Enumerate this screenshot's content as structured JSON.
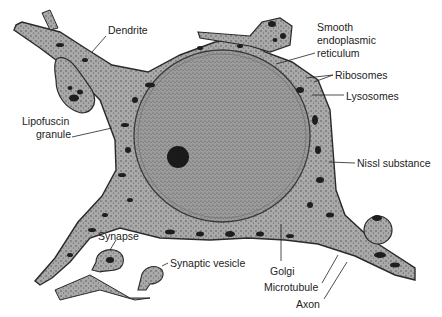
{
  "figure": {
    "colors": {
      "background": "#ffffff",
      "cytoplasm": "#a9a9a9",
      "nucleus": "#9a9a9a",
      "organelle": "#1e1e1e",
      "outline": "#2a2a2a",
      "label_text": "#222222"
    },
    "labels": [
      {
        "id": "dendrite",
        "text": "Dendrite",
        "x": 108,
        "y": 30
      },
      {
        "id": "smooth-er-1",
        "text": "Smooth",
        "x": 317,
        "y": 27
      },
      {
        "id": "smooth-er-2",
        "text": "endoplasmic",
        "x": 317,
        "y": 40
      },
      {
        "id": "smooth-er-3",
        "text": "reticulum",
        "x": 317,
        "y": 53
      },
      {
        "id": "ribosomes",
        "text": "Ribosomes",
        "x": 335,
        "y": 69
      },
      {
        "id": "lysosomes",
        "text": "Lysosomes",
        "x": 346,
        "y": 90
      },
      {
        "id": "lipofuscin-1",
        "text": "Lipofuscin",
        "x": 22,
        "y": 119
      },
      {
        "id": "lipofuscin-2",
        "text": "granule",
        "x": 36,
        "y": 132
      },
      {
        "id": "nissl",
        "text": "Nissl substance",
        "x": 357,
        "y": 157
      },
      {
        "id": "synapse",
        "text": "Synapse",
        "x": 98,
        "y": 230
      },
      {
        "id": "synaptic-vesicle",
        "text": "Synaptic vesicle",
        "x": 170,
        "y": 257
      },
      {
        "id": "golgi",
        "text": "Golgi",
        "x": 270,
        "y": 265
      },
      {
        "id": "microtubule",
        "text": "Microtubule",
        "x": 264,
        "y": 281
      },
      {
        "id": "axon",
        "text": "Axon",
        "x": 296,
        "y": 298
      }
    ],
    "leaders": [
      {
        "id": "dendrite",
        "x1": 106,
        "y1": 36,
        "x2": 92,
        "y2": 52
      },
      {
        "id": "smooth-er",
        "x1": 315,
        "y1": 53,
        "x2": 276,
        "y2": 64
      },
      {
        "id": "ribosomes-a",
        "x1": 333,
        "y1": 75,
        "x2": 306,
        "y2": 78
      },
      {
        "id": "ribosomes-b",
        "x1": 333,
        "y1": 75,
        "x2": 314,
        "y2": 82
      },
      {
        "id": "lysosomes",
        "x1": 344,
        "y1": 95,
        "x2": 312,
        "y2": 95
      },
      {
        "id": "lipofuscin",
        "x1": 72,
        "y1": 137,
        "x2": 112,
        "y2": 128
      },
      {
        "id": "nissl",
        "x1": 355,
        "y1": 163,
        "x2": 329,
        "y2": 162
      },
      {
        "id": "synapse",
        "x1": 116,
        "y1": 240,
        "x2": 110,
        "y2": 250
      },
      {
        "id": "synaptic-vesicle",
        "x1": 168,
        "y1": 263,
        "x2": 162,
        "y2": 266
      },
      {
        "id": "golgi",
        "x1": 281,
        "y1": 261,
        "x2": 281,
        "y2": 224
      },
      {
        "id": "microtubule",
        "x1": 322,
        "y1": 283,
        "x2": 338,
        "y2": 255
      },
      {
        "id": "axon",
        "x1": 324,
        "y1": 299,
        "x2": 347,
        "y2": 262
      }
    ]
  }
}
